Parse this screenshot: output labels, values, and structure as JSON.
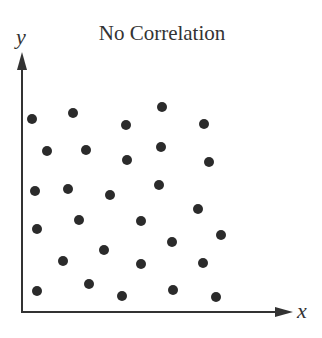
{
  "chart_data": {
    "type": "scatter",
    "title": "No Correlation",
    "xlabel": "x",
    "ylabel": "y",
    "grid": false,
    "legend": null,
    "axis_ticks": false,
    "x_range_px": [
      22,
      292
    ],
    "y_range_px": [
      312,
      55
    ],
    "points": [
      {
        "x": 32,
        "y": 119
      },
      {
        "x": 73,
        "y": 113
      },
      {
        "x": 126,
        "y": 125
      },
      {
        "x": 162,
        "y": 107
      },
      {
        "x": 204,
        "y": 124
      },
      {
        "x": 47,
        "y": 151
      },
      {
        "x": 86,
        "y": 150
      },
      {
        "x": 127,
        "y": 160
      },
      {
        "x": 161,
        "y": 147
      },
      {
        "x": 209,
        "y": 162
      },
      {
        "x": 35,
        "y": 191
      },
      {
        "x": 68,
        "y": 189
      },
      {
        "x": 110,
        "y": 195
      },
      {
        "x": 159,
        "y": 185
      },
      {
        "x": 198,
        "y": 209
      },
      {
        "x": 37,
        "y": 229
      },
      {
        "x": 79,
        "y": 220
      },
      {
        "x": 141,
        "y": 221
      },
      {
        "x": 221,
        "y": 235
      },
      {
        "x": 172,
        "y": 242
      },
      {
        "x": 104,
        "y": 250
      },
      {
        "x": 63,
        "y": 261
      },
      {
        "x": 141,
        "y": 264
      },
      {
        "x": 203,
        "y": 263
      },
      {
        "x": 37,
        "y": 291
      },
      {
        "x": 89,
        "y": 284
      },
      {
        "x": 122,
        "y": 296
      },
      {
        "x": 173,
        "y": 290
      },
      {
        "x": 216,
        "y": 297
      }
    ],
    "point_color": "#2b2b2b",
    "axis_color": "#333333"
  }
}
